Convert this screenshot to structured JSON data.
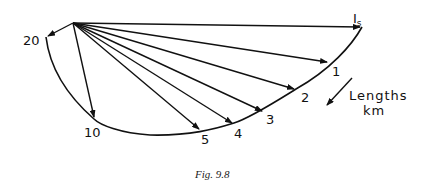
{
  "figure": {
    "caption": "Fig. 9.8",
    "legend": {
      "line1": "Lengths",
      "line2": "km"
    },
    "endpoint_label": {
      "main": "I",
      "subscript": "s"
    },
    "colors": {
      "ink": "#111111",
      "background": "#ffffff"
    }
  },
  "diagram": {
    "type": "phasor locus diagram",
    "origin": [
      73,
      23
    ],
    "phasors": [
      {
        "label": "Is",
        "length_km": 0,
        "tip": [
          362,
          27
        ]
      },
      {
        "label": "1",
        "length_km": 1,
        "tip": [
          329,
          62
        ]
      },
      {
        "label": "2",
        "length_km": 2,
        "tip": [
          296,
          89
        ]
      },
      {
        "label": "3",
        "length_km": 3,
        "tip": [
          264,
          111
        ]
      },
      {
        "label": "4",
        "length_km": 4,
        "tip": [
          234,
          123
        ]
      },
      {
        "label": "5",
        "length_km": 5,
        "tip": [
          200,
          130
        ]
      },
      {
        "label": "10",
        "length_km": 10,
        "tip": [
          94,
          119
        ]
      },
      {
        "label": "20",
        "length_km": 20,
        "tip": [
          46,
          37
        ]
      }
    ],
    "labels": {
      "p1": "1",
      "p2": "2",
      "p3": "3",
      "p4": "4",
      "p5": "5",
      "p10": "10",
      "p20": "20"
    },
    "direction_arrow": "increasing-length-direction"
  }
}
